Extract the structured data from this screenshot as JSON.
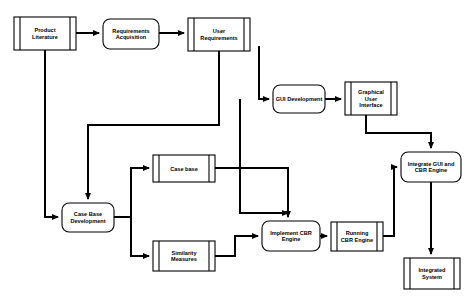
{
  "diagram": {
    "width": 474,
    "height": 299,
    "background_color": "#ffffff",
    "line_color": "#000000",
    "text_color": "#000000",
    "nodes": [
      {
        "id": "product-literature",
        "label": "Product\nLiterature",
        "lines": [
          "Product",
          "Literature"
        ],
        "shape": "predefined-process",
        "x": 14,
        "y": 17,
        "w": 62,
        "h": 33
      },
      {
        "id": "requirements-acquisition",
        "label": "Requirements\nAcquisition",
        "lines": [
          "Requirements",
          "Acquisition"
        ],
        "shape": "rounded-rect",
        "x": 103,
        "y": 19,
        "w": 56,
        "h": 30
      },
      {
        "id": "user-requirements",
        "label": "User\nRequirements",
        "lines": [
          "User",
          "Requirements"
        ],
        "shape": "predefined-process",
        "x": 188,
        "y": 18,
        "w": 62,
        "h": 33
      },
      {
        "id": "gui-development",
        "label": "GUI Development",
        "lines": [
          "GUI Development"
        ],
        "shape": "rounded-rect",
        "x": 273,
        "y": 85,
        "w": 52,
        "h": 28
      },
      {
        "id": "graphical-user-interface",
        "label": "Graphical\nUser\nInterface",
        "lines": [
          "Graphical",
          "User",
          "Interface"
        ],
        "shape": "predefined-process",
        "x": 345,
        "y": 82,
        "w": 52,
        "h": 33
      },
      {
        "id": "case-base",
        "label": "Case base",
        "lines": [
          "Case base"
        ],
        "shape": "predefined-process",
        "x": 153,
        "y": 155,
        "w": 62,
        "h": 27
      },
      {
        "id": "case-base-development",
        "label": "Case Base\nDevelopment",
        "lines": [
          "Case Base",
          "Development"
        ],
        "shape": "rounded-rect",
        "x": 62,
        "y": 203,
        "w": 52,
        "h": 29
      },
      {
        "id": "similarity-measures",
        "label": "Similarity\nMeasures",
        "lines": [
          "Similarity",
          "Measures"
        ],
        "shape": "predefined-process",
        "x": 153,
        "y": 241,
        "w": 62,
        "h": 30
      },
      {
        "id": "implement-cbr-engine",
        "label": "Implement CBR\nEngine",
        "lines": [
          "Implement CBR",
          "Engine"
        ],
        "shape": "rounded-rect",
        "x": 262,
        "y": 221,
        "w": 58,
        "h": 30
      },
      {
        "id": "running-cbr-engine",
        "label": "Running\nCBR Engine",
        "lines": [
          "Running",
          "CBR Engine"
        ],
        "shape": "predefined-process",
        "x": 331,
        "y": 222,
        "w": 52,
        "h": 29
      },
      {
        "id": "integrate-gui-and-cbr-engine",
        "label": "Integrate GUI and\nCBR Engine",
        "lines": [
          "Integrate GUI and",
          "CBR Engine"
        ],
        "shape": "rounded-rect",
        "x": 401,
        "y": 152,
        "w": 60,
        "h": 30
      },
      {
        "id": "integrated-system",
        "label": "Integrated\nSystem",
        "lines": [
          "Integrated",
          "System"
        ],
        "shape": "predefined-process",
        "x": 404,
        "y": 258,
        "w": 56,
        "h": 31
      }
    ],
    "edges": [
      {
        "id": "e1",
        "from": "product-literature",
        "to": "requirements-acquisition",
        "points": "76,33 99,33"
      },
      {
        "id": "e2",
        "from": "requirements-acquisition",
        "to": "user-requirements",
        "points": "159,33 184,33"
      },
      {
        "id": "e3",
        "from": "user-requirements",
        "to": "case-base-development",
        "points": "219,51 219,125 88,125 88,199"
      },
      {
        "id": "e4",
        "from": "product-literature",
        "to": "case-base-development",
        "points": "45,50 45,217 58,217"
      },
      {
        "id": "e5",
        "from": "user-requirements",
        "to": "gui-development",
        "points": "259,46 259,99 269,99"
      },
      {
        "id": "e6",
        "from": "gui-development",
        "to": "graphical-user-interface",
        "points": "325,99 341,99"
      },
      {
        "id": "e7",
        "from": "graphical-user-interface",
        "to": "integrate-gui-and-cbr-engine",
        "points": "366,115 366,133 431,133 431,148"
      },
      {
        "id": "e8",
        "from": "case-base-development",
        "to": "case-base",
        "points": "114,217 131,217 131,168 149,168"
      },
      {
        "id": "e9",
        "from": "case-base-development",
        "to": "similarity-measures",
        "points": "114,217 131,217 131,256 149,256"
      },
      {
        "id": "e10",
        "from": "case-base",
        "to": "implement-cbr-engine",
        "points": "215,168 288,168 288,217"
      },
      {
        "id": "e11",
        "from": "gui-development-branch",
        "to": "implement-cbr-engine",
        "points": "240,99 240,213 288,213"
      },
      {
        "id": "e12",
        "from": "similarity-measures",
        "to": "implement-cbr-engine",
        "points": "215,256 235,256 235,236 258,236"
      },
      {
        "id": "e13",
        "from": "implement-cbr-engine",
        "to": "running-cbr-engine",
        "points": "320,236 327,236"
      },
      {
        "id": "e14",
        "from": "running-cbr-engine",
        "to": "integrate-gui-and-cbr-engine",
        "points": "383,236 394,236 394,167 397,167"
      },
      {
        "id": "e15",
        "from": "integrate-gui-and-cbr-engine",
        "to": "integrated-system",
        "points": "431,182 431,254"
      }
    ]
  }
}
